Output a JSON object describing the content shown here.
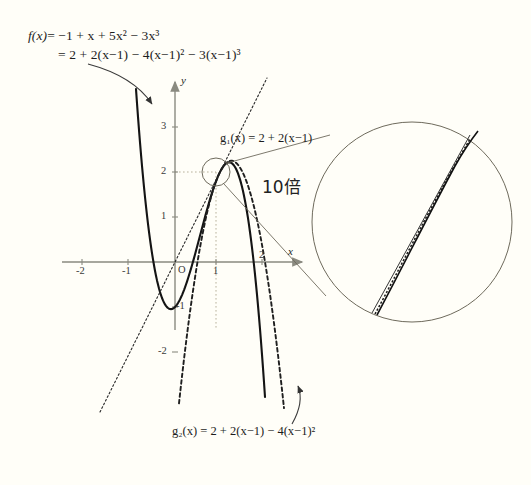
{
  "figure": {
    "background_color": "#fffef8",
    "curve_color": "#1a1a1a",
    "axis_color": "#8a8a80",
    "type": "math-diagram"
  },
  "formulas": {
    "f_line1_head": "f(x)",
    "f_line1": "= −1 + x + 5x² − 3x³",
    "f_line2": "= 2 + 2(x−1) − 4(x−1)² − 3(x−1)³",
    "g1": "g₁(x) = 2 + 2(x−1)",
    "g2": "g₂(x) = 2 + 2(x−1) − 4(x−1)²"
  },
  "axes": {
    "x_label": "x",
    "y_label": "y",
    "origin_label": "O",
    "x_ticks": [
      "-2",
      "-1",
      "1",
      "2"
    ],
    "y_ticks": [
      "3",
      "2",
      "1",
      "-1",
      "-2"
    ],
    "x_range": [
      -2.5,
      2.8
    ],
    "y_range": [
      -2.6,
      3.6
    ],
    "px_per_unit": 45,
    "origin_px": [
      175,
      262
    ]
  },
  "annotations": {
    "magnification": "10倍",
    "tangent_point": [
      1,
      2
    ],
    "highlight_circle_center_px": [
      216,
      172
    ],
    "highlight_circle_radius_px": 14,
    "magnified_circle_center_px": [
      412,
      222
    ],
    "magnified_circle_radius_px": 100
  },
  "chart_data": {
    "type": "line",
    "title": "",
    "xlabel": "x",
    "ylabel": "y",
    "xlim": [
      -2.5,
      2.8
    ],
    "ylim": [
      -2.6,
      3.6
    ],
    "grid": false,
    "legend": "none",
    "series": [
      {
        "name": "f(x) = -1 + x + 5x^2 - 3x^3",
        "style": "solid-thick",
        "expression": "-1 + x + 5*x^2 - 3*x^3",
        "notable_points": [
          [
            1,
            2
          ],
          [
            -0.49,
            -1.25
          ],
          [
            0,
            -1
          ]
        ]
      },
      {
        "name": "g1(x) = 2 + 2(x-1)",
        "style": "dotted-thin",
        "expression": "2 + 2*(x-1)",
        "notable_points": [
          [
            1,
            2
          ],
          [
            0,
            0
          ],
          [
            -1,
            -2
          ]
        ]
      },
      {
        "name": "g2(x) = 2 + 2(x-1) - 4(x-1)^2",
        "style": "dashed",
        "expression": "2 + 2*(x-1) - 4*(x-1)^2",
        "notable_points": [
          [
            1,
            2
          ],
          [
            1.25,
            2.25
          ],
          [
            2,
            -2
          ]
        ]
      }
    ]
  }
}
